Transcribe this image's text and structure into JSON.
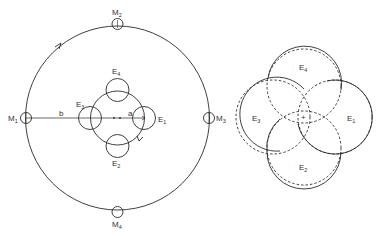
{
  "diagram": {
    "colors": {
      "stroke": "#2a2a2a",
      "background": "#ffffff"
    },
    "left": {
      "outer_orbit_labels": [
        "M1",
        "M2",
        "M3",
        "M4"
      ],
      "inner_orbit_labels": [
        "E1",
        "E2",
        "E3",
        "E4"
      ],
      "radius_labels": {
        "outer": "b",
        "inner": "a"
      }
    },
    "right": {
      "circle_labels": [
        "E1",
        "E2",
        "E3",
        "E4"
      ],
      "center_marker": "+"
    }
  },
  "labels": {
    "M1": "M",
    "M1_sub": "1",
    "M2": "M",
    "M2_sub": "2",
    "M3": "M",
    "M3_sub": "3",
    "M4": "M",
    "M4_sub": "4",
    "E1": "E",
    "E1_sub": "1",
    "E2": "E",
    "E2_sub": "2",
    "E3": "E",
    "E3_sub": "3",
    "E4": "E",
    "E4_sub": "4",
    "b": "b",
    "a": "a",
    "R_E1": "E",
    "R_E1_sub": "1",
    "R_E2": "E",
    "R_E2_sub": "2",
    "R_E3": "E",
    "R_E3_sub": "3",
    "R_E4": "E",
    "R_E4_sub": "4",
    "plus": "+"
  }
}
